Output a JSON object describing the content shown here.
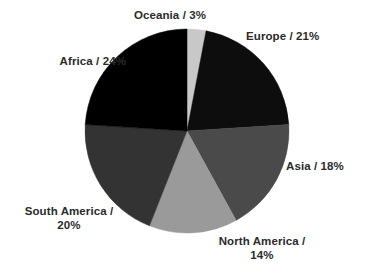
{
  "chart_data": {
    "type": "pie",
    "title": "",
    "subtitle": "",
    "xlabel": "",
    "ylabel": "",
    "grid": false,
    "legend": "none",
    "label_format": "{name} / {value}%",
    "start_angle_deg": 0,
    "direction": "clockwise",
    "categories": [
      "Oceania",
      "Europe",
      "Asia",
      "North America",
      "South America",
      "Africa"
    ],
    "values": [
      3,
      21,
      18,
      14,
      20,
      24
    ],
    "units": "%",
    "slices": [
      {
        "name": "Oceania",
        "value": 3,
        "label": "Oceania / 3%",
        "color": "#c8c8c8",
        "start_deg": 0,
        "end_deg": 10.8
      },
      {
        "name": "Europe",
        "value": 21,
        "label": "Europe / 21%",
        "color": "#0d0d0d",
        "start_deg": 10.8,
        "end_deg": 86.4
      },
      {
        "name": "Asia",
        "value": 18,
        "label": "Asia / 18%",
        "color": "#4a4a4a",
        "start_deg": 86.4,
        "end_deg": 151.2
      },
      {
        "name": "North America",
        "value": 14,
        "label": "North America /\n14%",
        "color": "#9a9a9a",
        "start_deg": 151.2,
        "end_deg": 201.6
      },
      {
        "name": "South America",
        "value": 20,
        "label": "South America /\n20%",
        "color": "#333333",
        "start_deg": 201.6,
        "end_deg": 273.6
      },
      {
        "name": "Africa",
        "value": 24,
        "label": "Africa / 24%",
        "color": "#000000",
        "start_deg": 273.6,
        "end_deg": 360
      }
    ],
    "geometry": {
      "center_x": 187,
      "center_y": 131,
      "radius": 102
    },
    "colors": {
      "background": "#ffffff",
      "label_text": "#2b2b2b"
    }
  }
}
